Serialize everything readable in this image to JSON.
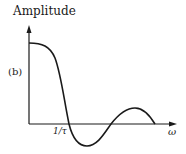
{
  "diagram": {
    "y_axis_label": "Amplitude",
    "panel_label": "(b)",
    "x_tick_label": "1/τ",
    "x_axis_label": "ω",
    "curve": "sinc-like amplitude spectrum",
    "stroke_color": "#1a1a1a"
  }
}
